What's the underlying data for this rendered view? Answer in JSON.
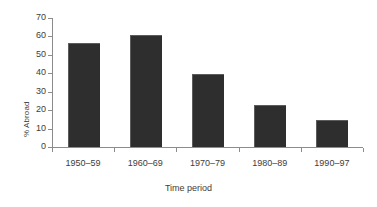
{
  "chart_data": {
    "type": "bar",
    "title": "",
    "xlabel": "Time period",
    "ylabel": "% Abroad",
    "categories": [
      "1950–59",
      "1960–69",
      "1970–79",
      "1980–89",
      "1990–97"
    ],
    "values": [
      56,
      60,
      39,
      22,
      14
    ],
    "series": [
      {
        "name": "% Abroad",
        "values": [
          56,
          60,
          39,
          22,
          14
        ]
      }
    ],
    "ylim": [
      0,
      70
    ],
    "ytick_step": 10,
    "yticks": [
      0,
      10,
      20,
      30,
      40,
      50,
      60,
      70
    ],
    "ytick_labels": [
      "0",
      "10",
      "20",
      "30",
      "40",
      "50",
      "60",
      "70"
    ],
    "grid": false,
    "legend": false,
    "legend_position": "none",
    "bar_color": "#2e2e2e",
    "axis_color": "#8c8c8c",
    "text_color": "#3d3d3d",
    "background_color": "#ffffff"
  }
}
